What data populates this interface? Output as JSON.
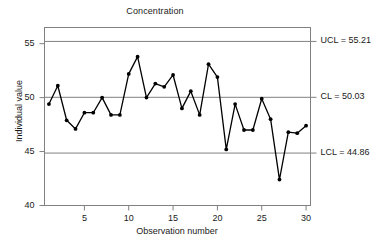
{
  "chart_data": {
    "type": "line",
    "title": "Concentration",
    "xlabel": "Observation number",
    "ylabel": "Individual value",
    "grid": true,
    "legend": "none",
    "xlim": [
      0.5,
      30.5
    ],
    "ylim": [
      40,
      56.5
    ],
    "yticks": [
      "40",
      "45",
      "50",
      "55"
    ],
    "ytick_values": [
      40,
      45,
      50,
      55
    ],
    "xticks": [
      "5",
      "10",
      "15",
      "20",
      "25",
      "30"
    ],
    "xtick_values": [
      5,
      10,
      15,
      20,
      25,
      30
    ],
    "x": [
      1,
      2,
      3,
      4,
      5,
      6,
      7,
      8,
      9,
      10,
      11,
      12,
      13,
      14,
      15,
      16,
      17,
      18,
      19,
      20,
      21,
      22,
      23,
      24,
      25,
      26,
      27,
      28,
      29,
      30
    ],
    "values": [
      49.4,
      51.1,
      47.9,
      47.1,
      48.6,
      48.6,
      50.0,
      48.4,
      48.4,
      52.2,
      53.8,
      50.0,
      51.3,
      51.0,
      52.1,
      49.0,
      50.6,
      48.4,
      53.1,
      51.9,
      45.2,
      49.4,
      47.0,
      47.0,
      49.9,
      48.0,
      42.4,
      46.8,
      46.7,
      47.4
    ],
    "series_name": "Individual value",
    "control_limits": [
      {
        "key": "ucl",
        "label": "UCL = 55.21",
        "value": 55.21
      },
      {
        "key": "cl",
        "label": "CL = 50.03",
        "value": 50.03
      },
      {
        "key": "lcl",
        "label": "LCL = 44.86",
        "value": 44.86
      }
    ],
    "colors": {
      "line": "#000000",
      "marker": "#000000",
      "limit_line": "#808080",
      "frame": "#808080",
      "background": "#ffffff"
    }
  }
}
